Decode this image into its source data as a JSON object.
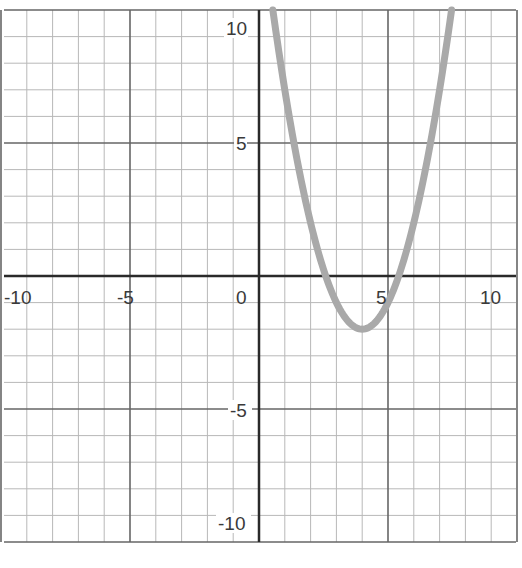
{
  "chart_data": {
    "type": "line",
    "title": "",
    "xlabel": "",
    "ylabel": "",
    "xlim": [
      -10,
      10
    ],
    "ylim": [
      -10,
      10
    ],
    "grid": true,
    "grid_step": 1,
    "major_step": 5,
    "x_tick_labels": [
      "-10",
      "-5",
      "0",
      "5",
      "10"
    ],
    "y_tick_labels": [
      "10",
      "5",
      "-5",
      "-10"
    ],
    "series": [
      {
        "name": "parabola",
        "equation": "y = (x - 4)^2 - 2",
        "vertex": [
          4,
          -2
        ],
        "roots": [
          2.59,
          5.41
        ],
        "color": "#a9a9a9",
        "x": [
          0.54,
          1,
          1.5,
          2,
          2.5,
          3,
          3.5,
          4,
          4.5,
          5,
          5.5,
          6,
          6.5,
          7,
          7.46
        ],
        "y": [
          10,
          7,
          4.25,
          2,
          0.25,
          -1,
          -1.75,
          -2,
          -1.75,
          -1,
          0.25,
          2,
          4.25,
          7,
          10
        ]
      }
    ],
    "legend": null
  },
  "colors": {
    "minor_grid": "#b8b8b8",
    "major_grid": "#666666",
    "axis": "#2a2a2a",
    "curve": "#a9a9a9",
    "background": "#ffffff"
  }
}
